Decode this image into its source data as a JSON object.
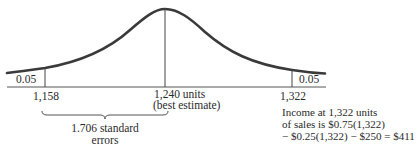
{
  "diagram": {
    "type": "normal-distribution",
    "tail_left": {
      "probability": "0.05",
      "x_label": "1,158"
    },
    "center": {
      "x_label": "1,240 units",
      "sub_label": "(best estimate)"
    },
    "tail_right": {
      "probability": "0.05",
      "x_label": "1,322"
    },
    "brace": {
      "line1": "1.706 standard",
      "line2": "errors"
    },
    "income_note": {
      "line1": "Income at 1,322 units",
      "line2": "of sales is  $0.75(1,322)",
      "line3": "− $0.25(1,322) − $250 = $411"
    },
    "colors": {
      "curve": "#3a3a3a",
      "lines": "#444444",
      "text": "#2a2a2a"
    }
  }
}
